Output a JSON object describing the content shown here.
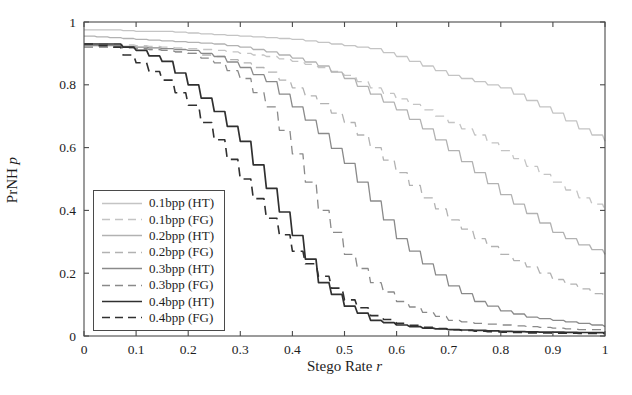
{
  "figure": {
    "background": "#ffffff"
  },
  "axis": {
    "frame_color": "#4a4a4a",
    "tick_color": "#4a4a4a",
    "text_color": "#1d1d1d"
  },
  "chart_data": {
    "type": "line",
    "line_shape": "staircase-step",
    "title": "",
    "xlabel_text": "Stego Rate",
    "xlabel_var": "r",
    "ylabel_text": "PrNH",
    "ylabel_var": "p",
    "xlim": [
      0,
      1
    ],
    "ylim": [
      0,
      1
    ],
    "x_tick_labels": [
      "0",
      "0.1",
      "0.2",
      "0.3",
      "0.4",
      "0.5",
      "0.6",
      "0.7",
      "0.8",
      "0.9",
      "1"
    ],
    "y_tick_labels": [
      "0",
      "0.2",
      "0.4",
      "0.6",
      "0.8",
      "1"
    ],
    "grid": false,
    "legend_position": "lower-left-inside",
    "ticks_on_all_sides": true,
    "x": [
      0,
      0.05,
      0.1,
      0.15,
      0.2,
      0.25,
      0.3,
      0.35,
      0.4,
      0.45,
      0.5,
      0.55,
      0.6,
      0.65,
      0.7,
      0.75,
      0.8,
      0.85,
      0.9,
      0.95,
      1
    ],
    "series": [
      {
        "name": "0.1bpp (HT)",
        "bpp": 0.1,
        "detector": "HT",
        "style": "solid",
        "color": "#c4c4c4",
        "width": 1.3,
        "values": [
          0.975,
          0.975,
          0.97,
          0.97,
          0.965,
          0.96,
          0.955,
          0.95,
          0.945,
          0.935,
          0.925,
          0.915,
          0.89,
          0.86,
          0.83,
          0.81,
          0.79,
          0.75,
          0.71,
          0.66,
          0.62
        ]
      },
      {
        "name": "0.1bpp (FG)",
        "bpp": 0.1,
        "detector": "FG",
        "style": "dashed",
        "color": "#c4c4c4",
        "width": 1.3,
        "values": [
          0.93,
          0.93,
          0.925,
          0.92,
          0.915,
          0.91,
          0.9,
          0.89,
          0.875,
          0.855,
          0.83,
          0.79,
          0.755,
          0.72,
          0.68,
          0.64,
          0.59,
          0.54,
          0.49,
          0.44,
          0.4
        ]
      },
      {
        "name": "0.2bpp (HT)",
        "bpp": 0.2,
        "detector": "HT",
        "style": "solid",
        "color": "#b2b2b2",
        "width": 1.3,
        "values": [
          0.955,
          0.95,
          0.945,
          0.94,
          0.935,
          0.93,
          0.92,
          0.905,
          0.885,
          0.86,
          0.82,
          0.77,
          0.72,
          0.66,
          0.59,
          0.52,
          0.45,
          0.39,
          0.33,
          0.29,
          0.26
        ]
      },
      {
        "name": "0.2bpp (FG)",
        "bpp": 0.2,
        "detector": "FG",
        "style": "dashed",
        "color": "#b2b2b2",
        "width": 1.3,
        "values": [
          0.92,
          0.92,
          0.915,
          0.91,
          0.9,
          0.89,
          0.87,
          0.84,
          0.79,
          0.74,
          0.68,
          0.6,
          0.52,
          0.44,
          0.37,
          0.31,
          0.26,
          0.22,
          0.18,
          0.15,
          0.12
        ]
      },
      {
        "name": "0.3bpp (HT)",
        "bpp": 0.3,
        "detector": "HT",
        "style": "solid",
        "color": "#8a8a8a",
        "width": 1.3,
        "values": [
          0.925,
          0.925,
          0.92,
          0.915,
          0.91,
          0.89,
          0.855,
          0.81,
          0.73,
          0.645,
          0.55,
          0.43,
          0.31,
          0.23,
          0.16,
          0.11,
          0.08,
          0.06,
          0.05,
          0.04,
          0.03
        ]
      },
      {
        "name": "0.3bpp (FG)",
        "bpp": 0.3,
        "detector": "FG",
        "style": "dashed",
        "color": "#8a8a8a",
        "width": 1.3,
        "values": [
          0.92,
          0.92,
          0.915,
          0.91,
          0.9,
          0.87,
          0.82,
          0.73,
          0.58,
          0.4,
          0.26,
          0.17,
          0.11,
          0.075,
          0.05,
          0.04,
          0.035,
          0.03,
          0.025,
          0.02,
          0.02
        ]
      },
      {
        "name": "0.4bpp (HT)",
        "bpp": 0.4,
        "detector": "HT",
        "style": "solid",
        "color": "#303030",
        "width": 1.7,
        "values": [
          0.93,
          0.93,
          0.91,
          0.875,
          0.8,
          0.715,
          0.62,
          0.47,
          0.32,
          0.17,
          0.095,
          0.05,
          0.035,
          0.025,
          0.02,
          0.018,
          0.015,
          0.013,
          0.012,
          0.011,
          0.01
        ]
      },
      {
        "name": "0.4bpp (FG)",
        "bpp": 0.4,
        "detector": "FG",
        "style": "dashed",
        "color": "#303030",
        "width": 1.6,
        "values": [
          0.93,
          0.92,
          0.87,
          0.815,
          0.735,
          0.625,
          0.5,
          0.375,
          0.27,
          0.19,
          0.115,
          0.065,
          0.04,
          0.028,
          0.02,
          0.015,
          0.012,
          0.01,
          0.009,
          0.008,
          0.008
        ]
      }
    ]
  }
}
